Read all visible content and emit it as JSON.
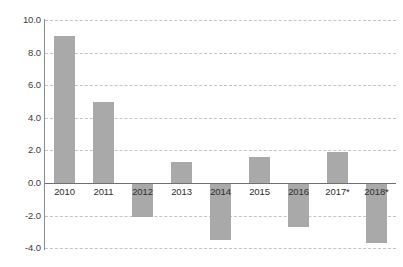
{
  "chart_data": {
    "type": "bar",
    "title": "",
    "subtitle": "",
    "xlabel": "",
    "ylabel": "",
    "categories": [
      "2010",
      "2011",
      "2012",
      "2013",
      "2014",
      "2015",
      "2016",
      "2017*",
      "2018*"
    ],
    "values": [
      9.0,
      5.0,
      -2.1,
      1.3,
      -3.5,
      1.6,
      -2.7,
      1.9,
      -3.7
    ],
    "series": [
      {
        "name": "",
        "values": [
          9.0,
          5.0,
          -2.1,
          1.3,
          -3.5,
          1.6,
          -2.7,
          1.9,
          -3.7
        ]
      }
    ],
    "ylim": [
      -4.0,
      10.0
    ],
    "yticks": [
      10.0,
      8.0,
      6.0,
      4.0,
      2.0,
      0.0,
      -2.0,
      -4.0
    ],
    "ytick_labels": [
      "10.0",
      "8.0",
      "6.0",
      "4.0",
      "2.0",
      "0.0",
      "-2.0",
      "-4.0"
    ],
    "grid": true,
    "grid_axis": "y",
    "grid_style": "dashed",
    "legend": null,
    "legend_position": "none",
    "bar_color": "#a9a9a9",
    "grid_color": "#b9c6d6",
    "axis_color": "#8a8a8a",
    "zero_line_color": "#6f6f6f",
    "background_color": "#ffffff",
    "annotations": [
      "* denotes projected/estimated values"
    ]
  },
  "axis": {
    "y_labels": [
      "10.0",
      "8.0",
      "6.0",
      "4.0",
      "2.0",
      "0.0",
      "-2.0",
      "-4.0"
    ],
    "x_labels": [
      "2010",
      "2011",
      "2012",
      "2013",
      "2014",
      "2015",
      "2016",
      "2017*",
      "2018*"
    ]
  }
}
